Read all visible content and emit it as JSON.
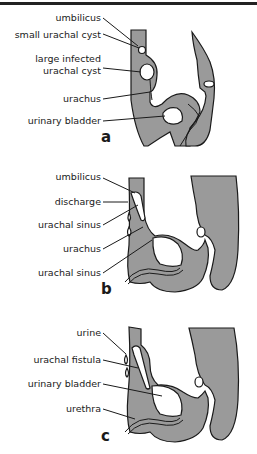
{
  "figure": {
    "panels": [
      {
        "letter": "a",
        "labels": [
          "umbilicus",
          "small urachal cyst",
          "large infected",
          "urachal cyst",
          "urachus",
          "urinary bladder"
        ]
      },
      {
        "letter": "b",
        "labels": [
          "umbilicus",
          "discharge",
          "urachal sinus",
          "urachus",
          "urachal sinus"
        ]
      },
      {
        "letter": "c",
        "labels": [
          "urine",
          "urachal fistula",
          "urinary bladder",
          "urethra"
        ]
      }
    ],
    "colors": {
      "tissue": "#9a9a9a",
      "outline": "#1a1a1a",
      "background": "#ffffff"
    }
  }
}
